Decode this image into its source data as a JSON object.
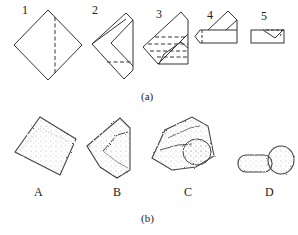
{
  "figure": {
    "part_a": {
      "caption": "(a)",
      "steps": [
        {
          "label": "1",
          "description": "square paper as diamond with dashed vertical fold line"
        },
        {
          "label": "2",
          "description": "left corner folded, dashed horizontal line"
        },
        {
          "label": "3",
          "description": "multiple folds with dashed horizontal lines"
        },
        {
          "label": "4",
          "description": "folded into pentagon strip with triangular flap"
        },
        {
          "label": "5",
          "description": "final rectangular folded packet"
        }
      ]
    },
    "part_b": {
      "caption": "(b)",
      "samples": [
        {
          "label": "A",
          "description": "square diamond-shaped textured sample"
        },
        {
          "label": "B",
          "description": "triangular folded textured sample"
        },
        {
          "label": "C",
          "description": "irregular folded textured sample"
        },
        {
          "label": "D",
          "description": "mushroom/knob-shaped rolled sample"
        }
      ]
    },
    "colors": {
      "line": "#333333",
      "texture": "#555555"
    }
  }
}
